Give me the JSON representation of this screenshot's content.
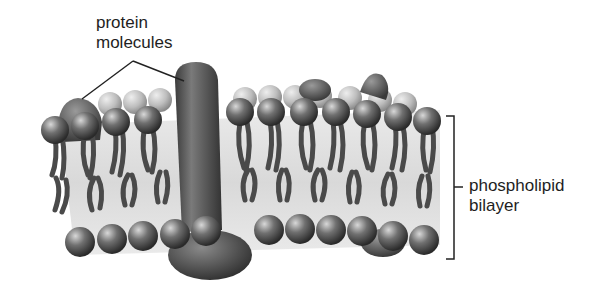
{
  "diagram": {
    "labels": {
      "protein_line1": "protein",
      "protein_line2": "molecules",
      "bilayer_line1": "phospholipid",
      "bilayer_line2": "bilayer"
    },
    "components": [
      {
        "name": "protein molecules",
        "type": "callout with two leader lines",
        "targets": [
          "small peripheral protein (left)",
          "large transmembrane protein (center)"
        ]
      },
      {
        "name": "phospholipid bilayer",
        "type": "bracket callout",
        "spans": "top heads to bottom heads"
      }
    ],
    "colors": {
      "head_dark": "#3a3a3a",
      "head_light": "#bdbdbd",
      "tail": "#4a4a4a",
      "protein": "#555555",
      "background": "#ffffff",
      "text": "#1e1e1e"
    }
  }
}
